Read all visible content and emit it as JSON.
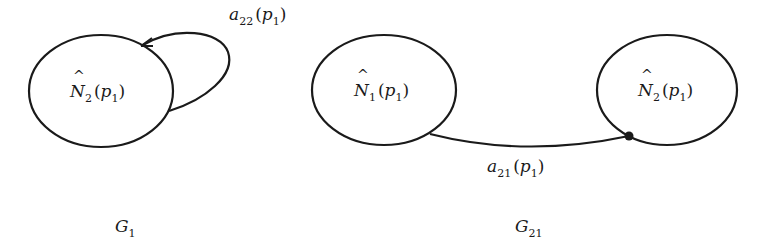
{
  "graphs": [
    {
      "id": "G1",
      "label": {
        "main": "G",
        "sub": "1"
      },
      "nodes": [
        {
          "id": "N2",
          "symbol": "N",
          "hat": "^",
          "index": "2",
          "arg": "p",
          "arg_sub": "1",
          "text": "N̂2(p1)"
        }
      ],
      "edges": [
        {
          "from": "N2",
          "to": "N2",
          "type": "self-loop",
          "arrow": "arrowhead",
          "label": {
            "main": "a",
            "sub": "22",
            "arg": "p",
            "arg_sub": "1",
            "text": "a22(p1)"
          }
        }
      ]
    },
    {
      "id": "G21",
      "label": {
        "main": "G",
        "sub": "21"
      },
      "nodes": [
        {
          "id": "N1",
          "symbol": "N",
          "hat": "^",
          "index": "1",
          "arg": "p",
          "arg_sub": "1",
          "text": "N̂1(p1)"
        },
        {
          "id": "N2",
          "symbol": "N",
          "hat": "^",
          "index": "2",
          "arg": "p",
          "arg_sub": "1",
          "text": "N̂2(p1)"
        }
      ],
      "edges": [
        {
          "from": "N1",
          "to": "N2",
          "type": "curve",
          "arrow": "dot",
          "label": {
            "main": "a",
            "sub": "21",
            "arg": "p",
            "arg_sub": "1",
            "text": "a21(p1)"
          }
        }
      ]
    }
  ],
  "labels": {
    "g1_node_symbol": "N",
    "g1_node_index": "2",
    "g1_node_arg": "p",
    "g1_node_arg_sub": "1",
    "g1_edge_main": "a",
    "g1_edge_sub": "22",
    "g1_edge_arg": "p",
    "g1_edge_arg_sub": "1",
    "g1_caption_main": "G",
    "g1_caption_sub": "1",
    "g21_node1_symbol": "N",
    "g21_node1_index": "1",
    "g21_node1_arg": "p",
    "g21_node1_arg_sub": "1",
    "g21_node2_symbol": "N",
    "g21_node2_index": "2",
    "g21_node2_arg": "p",
    "g21_node2_arg_sub": "1",
    "g21_edge_main": "a",
    "g21_edge_sub": "21",
    "g21_edge_arg": "p",
    "g21_edge_arg_sub": "1",
    "g21_caption_main": "G",
    "g21_caption_sub": "21",
    "open_paren": "(",
    "close_paren": ")",
    "hat": "^"
  },
  "colors": {
    "stroke": "#1a1a1a",
    "background": "#ffffff"
  }
}
